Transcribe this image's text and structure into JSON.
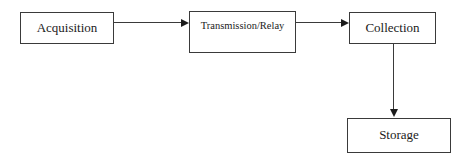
{
  "diagram": {
    "type": "flowchart",
    "orientation": "left-to-right-then-down",
    "background_color": "#ffffff",
    "line_color": "#3a3a3a",
    "text_color": "#1b1b1b",
    "nodes": [
      {
        "id": "acquisition",
        "label": "Acquisition",
        "shape": "rectangle",
        "x": 20,
        "y": 12,
        "width": 94,
        "height": 32
      },
      {
        "id": "transmission",
        "label": "Transmission/Relay",
        "shape": "rectangle",
        "x": 189,
        "y": 11,
        "width": 107,
        "height": 42
      },
      {
        "id": "collection",
        "label": "Collection",
        "shape": "rectangle",
        "x": 349,
        "y": 12,
        "width": 87,
        "height": 32
      },
      {
        "id": "storage",
        "label": "Storage",
        "shape": "rectangle",
        "x": 347,
        "y": 118,
        "width": 104,
        "height": 35
      }
    ],
    "edges": [
      {
        "id": "acquisition-transmission",
        "from": "acquisition",
        "to": "transmission",
        "direction": "right",
        "arrowhead": "arrow-right-icon",
        "label": ""
      },
      {
        "id": "transmission-collection",
        "from": "transmission",
        "to": "collection",
        "direction": "right",
        "arrowhead": "arrow-right-icon",
        "label": ""
      },
      {
        "id": "collection-storage",
        "from": "collection",
        "to": "storage",
        "direction": "down",
        "arrowhead": "arrow-down-icon",
        "label": ""
      }
    ]
  }
}
